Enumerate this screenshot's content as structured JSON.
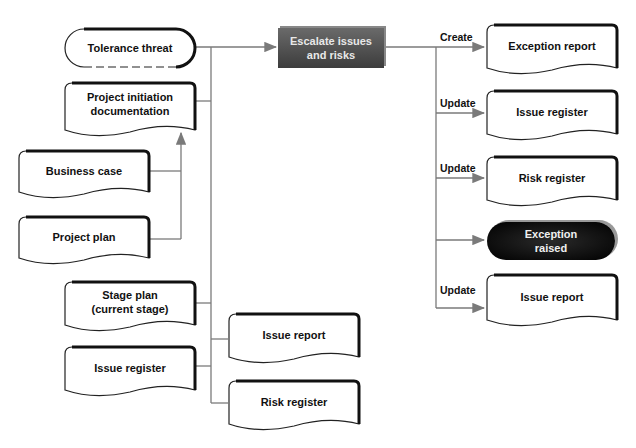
{
  "diagram": {
    "central_process": {
      "label": "Escalate issues and risks",
      "line1": "Escalate issues",
      "line2": "and risks"
    },
    "inputs": {
      "tolerance_threat": "Tolerance threat",
      "pid_line1": "Project initiation",
      "pid_line2": "documentation",
      "business_case": "Business case",
      "project_plan": "Project plan",
      "stage_plan_line1": "Stage plan",
      "stage_plan_line2": "(current stage)",
      "issue_register": "Issue register",
      "issue_report": "Issue report",
      "risk_register": "Risk register"
    },
    "outputs": {
      "exception_report": {
        "action": "Create",
        "label": "Exception report"
      },
      "issue_register": {
        "action": "Update",
        "label": "Issue register"
      },
      "risk_register": {
        "action": "Update",
        "label": "Risk register"
      },
      "exception_raised": {
        "line1": "Exception",
        "line2": "raised"
      },
      "issue_report": {
        "action": "Update",
        "label": "Issue report"
      }
    },
    "colors": {
      "line": "#7a7a7a",
      "process_fill": "#4a4a4a",
      "event_fill": "#0a0a0a",
      "doc_border": "#222222"
    }
  }
}
